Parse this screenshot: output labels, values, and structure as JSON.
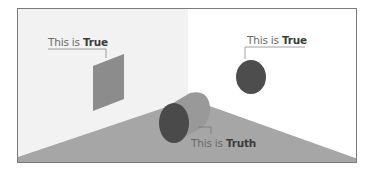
{
  "labels": {
    "wall": {
      "prefix": "This is ",
      "emphasis": "True"
    },
    "circle": {
      "prefix": "This is ",
      "emphasis": "True"
    },
    "cylinder": {
      "prefix": "This is ",
      "emphasis": "Truth"
    }
  },
  "colors": {
    "background": "#ffffff",
    "left_wall": "#f2f2f2",
    "floor": "#a6a6a6",
    "wall_square": "#8c8c8c",
    "circle": "#4d4d4d",
    "cylinder_body": "#999999",
    "cylinder_face": "#4a4a4a",
    "frame_border": "#7a7a7a",
    "leader_line": "#888888"
  }
}
